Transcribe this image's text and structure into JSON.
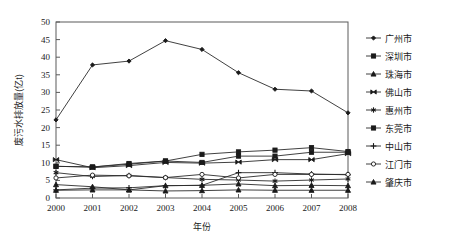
{
  "chart_data": {
    "type": "line",
    "title": "",
    "xlabel": "年份",
    "ylabel": "废污水排放量(亿t)",
    "x": [
      2000,
      2001,
      2002,
      2003,
      2004,
      2005,
      2006,
      2007,
      2008
    ],
    "xtick_labels": [
      "2000",
      "2001",
      "2002",
      "2003",
      "2004",
      "2005",
      "2006",
      "2007",
      "2008"
    ],
    "ytick_labels": [
      "0",
      "5",
      "10",
      "15",
      "20",
      "25",
      "30",
      "35",
      "40",
      "45",
      "50"
    ],
    "yticks": [
      0,
      5,
      10,
      15,
      20,
      25,
      30,
      35,
      40,
      45,
      50
    ],
    "ylim": [
      0,
      50
    ],
    "xlim": [
      2000,
      2008
    ],
    "grid": false,
    "legend_position": "right",
    "line_color": "#2b2b2b",
    "series": [
      {
        "name": "广州市",
        "marker": "diamond",
        "values": [
          22.2,
          37.8,
          38.9,
          44.7,
          42.2,
          35.6,
          30.9,
          30.4,
          24.2
        ]
      },
      {
        "name": "深圳市",
        "marker": "square",
        "values": [
          9.0,
          8.8,
          9.6,
          10.5,
          12.4,
          13.1,
          13.6,
          14.3,
          13.2
        ]
      },
      {
        "name": "珠海市",
        "marker": "triangle",
        "values": [
          2.2,
          2.3,
          2.3,
          2.0,
          2.1,
          2.3,
          2.2,
          2.2,
          2.2
        ]
      },
      {
        "name": "佛山市",
        "marker": "bowtie",
        "values": [
          10.9,
          8.6,
          9.2,
          10.1,
          9.9,
          10.2,
          10.9,
          10.9,
          12.6
        ]
      },
      {
        "name": "惠州市",
        "marker": "asterisk",
        "values": [
          7.2,
          6.1,
          6.4,
          5.8,
          5.3,
          5.1,
          4.8,
          5.1,
          5.4
        ]
      },
      {
        "name": "东莞市",
        "marker": "square-filled",
        "values": [
          9.0,
          8.8,
          9.8,
          10.5,
          10.1,
          11.9,
          11.9,
          13.0,
          13.0
        ]
      },
      {
        "name": "中山市",
        "marker": "plus",
        "values": [
          2.3,
          2.8,
          2.9,
          3.5,
          3.6,
          7.2,
          7.2,
          6.8,
          6.6
        ]
      },
      {
        "name": "江门市",
        "marker": "circle-open",
        "values": [
          5.7,
          6.5,
          6.3,
          5.8,
          6.7,
          5.7,
          6.7,
          6.7,
          6.7
        ]
      },
      {
        "name": "肇庆市",
        "marker": "triangle-filled",
        "values": [
          3.8,
          3.2,
          2.3,
          3.5,
          3.6,
          4.0,
          3.5,
          3.6,
          3.5
        ]
      }
    ]
  },
  "axes": {
    "x_label": "年份",
    "y_label": "废污水排放量(亿t)"
  },
  "legend": {
    "items": [
      {
        "label": "广州市"
      },
      {
        "label": "深圳市"
      },
      {
        "label": "珠海市"
      },
      {
        "label": "佛山市"
      },
      {
        "label": "惠州市"
      },
      {
        "label": "东莞市"
      },
      {
        "label": "中山市"
      },
      {
        "label": "江门市"
      },
      {
        "label": "肇庆市"
      }
    ]
  }
}
